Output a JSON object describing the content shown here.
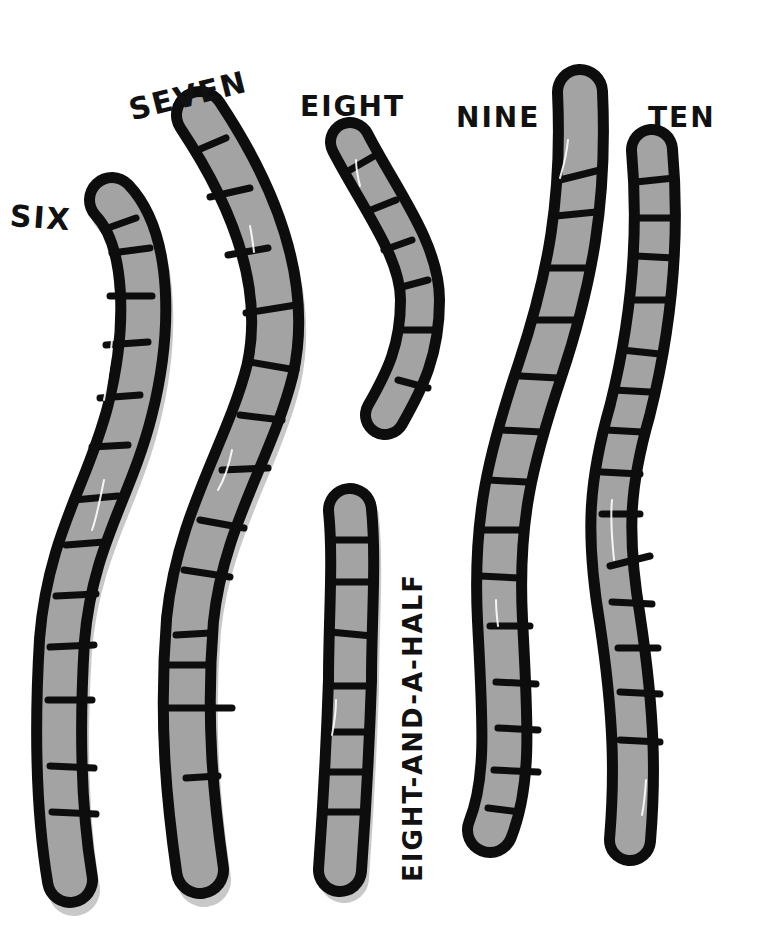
{
  "illustration": {
    "background": "#ffffff",
    "outline_color": "#0d0d0d",
    "fill_color": "#a3a3a3",
    "worms": [
      {
        "id": "six",
        "label": "SIX",
        "segments": 14
      },
      {
        "id": "seven",
        "label": "SEVEN",
        "segments": 15
      },
      {
        "id": "eight",
        "label": "EIGHT",
        "segments": 8
      },
      {
        "id": "eight-and-a-half",
        "label": "EIGHT-AND-A-HALF",
        "segments": 9
      },
      {
        "id": "nine",
        "label": "NINE",
        "segments": 17
      },
      {
        "id": "ten",
        "label": "TEN",
        "segments": 18
      }
    ]
  }
}
